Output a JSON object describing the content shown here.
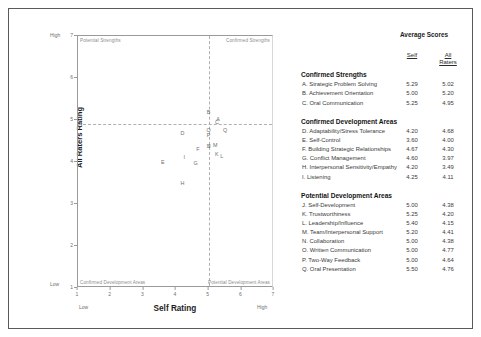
{
  "chart_data": {
    "type": "scatter",
    "title": "",
    "xlabel": "Self Rating",
    "ylabel": "All Raters Rating",
    "xlim": [
      1,
      7
    ],
    "ylim": [
      1,
      7
    ],
    "xticks": [
      "1",
      "2",
      "3",
      "4",
      "5",
      "6",
      "7"
    ],
    "yticks": [
      "1",
      "2",
      "3",
      "4",
      "5",
      "6",
      "7"
    ],
    "x_low_label": "Low",
    "x_high_label": "High",
    "y_low_label": "Low",
    "y_high_label": "High",
    "grid": false,
    "reference_lines": {
      "x": 5.0,
      "y": 4.9
    },
    "quadrants": {
      "top_left": "Potential Strengths",
      "top_right": "Confirmed Strengths",
      "bottom_left": "Confirmed Development Areas",
      "bottom_right": "Potential Development Areas"
    },
    "point_label_key": "letter",
    "points": [
      {
        "letter": "A",
        "x": 5.29,
        "y": 5.02
      },
      {
        "letter": "B",
        "x": 5.0,
        "y": 5.2
      },
      {
        "letter": "C",
        "x": 5.25,
        "y": 4.95
      },
      {
        "letter": "D",
        "x": 4.2,
        "y": 4.68
      },
      {
        "letter": "E",
        "x": 3.6,
        "y": 4.0
      },
      {
        "letter": "F",
        "x": 4.67,
        "y": 4.3
      },
      {
        "letter": "G",
        "x": 4.6,
        "y": 3.97
      },
      {
        "letter": "H",
        "x": 4.2,
        "y": 3.49
      },
      {
        "letter": "I",
        "x": 4.25,
        "y": 4.11
      },
      {
        "letter": "J",
        "x": 5.0,
        "y": 4.38
      },
      {
        "letter": "K",
        "x": 5.25,
        "y": 4.2
      },
      {
        "letter": "L",
        "x": 5.4,
        "y": 4.15
      },
      {
        "letter": "M",
        "x": 5.2,
        "y": 4.41
      },
      {
        "letter": "N",
        "x": 5.0,
        "y": 4.38
      },
      {
        "letter": "O",
        "x": 5.0,
        "y": 4.77
      },
      {
        "letter": "P",
        "x": 5.0,
        "y": 4.64
      },
      {
        "letter": "Q",
        "x": 5.5,
        "y": 4.76
      }
    ]
  },
  "table": {
    "title": "Average Scores",
    "col_self": "Self",
    "col_all": "All\nRaters",
    "col_all_line1": "All",
    "col_all_line2": "Raters",
    "groups": [
      {
        "heading": "Confirmed Strengths",
        "rows": [
          {
            "name": "A. Strategic Problem Solving",
            "self": "5.29",
            "all": "5.02"
          },
          {
            "name": "B. Achievement Orientation",
            "self": "5.00",
            "all": "5.20"
          },
          {
            "name": "C. Oral Communication",
            "self": "5.25",
            "all": "4.95"
          }
        ]
      },
      {
        "heading": "Confirmed Development Areas",
        "rows": [
          {
            "name": "D. Adaptability/Stress Tolerance",
            "self": "4.20",
            "all": "4.68"
          },
          {
            "name": "E. Self-Control",
            "self": "3.60",
            "all": "4.00"
          },
          {
            "name": "F. Building Strategic Relationships",
            "self": "4.67",
            "all": "4.30"
          },
          {
            "name": "G. Conflict Management",
            "self": "4.60",
            "all": "3.97"
          },
          {
            "name": "H. Interpersonal Sensitivity/Empathy",
            "self": "4.20",
            "all": "3.49"
          },
          {
            "name": "I. Listening",
            "self": "4.25",
            "all": "4.11"
          }
        ]
      },
      {
        "heading": "Potential Development Areas",
        "rows": [
          {
            "name": "J. Self-Development",
            "self": "5.00",
            "all": "4.38"
          },
          {
            "name": "K. Trustworthiness",
            "self": "5.25",
            "all": "4.20"
          },
          {
            "name": "L. Leadership/Influence",
            "self": "5.40",
            "all": "4.15"
          },
          {
            "name": "M. Team/Interpersonal Support",
            "self": "5.20",
            "all": "4.41"
          },
          {
            "name": "N. Collaboration",
            "self": "5.00",
            "all": "4.38"
          },
          {
            "name": "O. Written Communication",
            "self": "5.00",
            "all": "4.77"
          },
          {
            "name": "P. Two-Way Feedback",
            "self": "5.00",
            "all": "4.64"
          },
          {
            "name": "Q. Oral Presentation",
            "self": "5.50",
            "all": "4.76"
          }
        ]
      }
    ]
  }
}
